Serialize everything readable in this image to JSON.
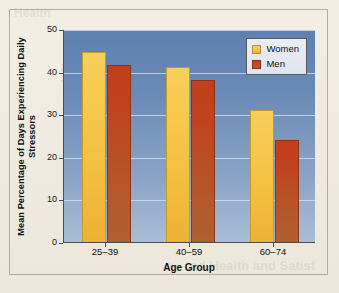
{
  "chart_data": {
    "type": "bar",
    "title": "",
    "xlabel": "Age Group",
    "ylabel": "Mean Percentage of Days Experiencing Daily Stressors",
    "categories": [
      "25–39",
      "40–59",
      "60–74"
    ],
    "series": [
      {
        "name": "Women",
        "values": [
          44.5,
          41.0,
          31.0
        ],
        "color": "#f3bf3f"
      },
      {
        "name": "Men",
        "values": [
          41.5,
          38.0,
          24.0
        ],
        "color": "#bf4a21"
      }
    ],
    "ylim": [
      0,
      50
    ],
    "yticks": [
      0,
      10,
      20,
      30,
      40,
      50
    ],
    "ytick_labels": [
      "0",
      "10",
      "20",
      "30",
      "40",
      "50"
    ],
    "grid": true,
    "legend_position": "top-right"
  },
  "legend": {
    "entries": [
      {
        "label": "Women",
        "swatch": "women-swatch"
      },
      {
        "label": "Men",
        "swatch": "men-swatch"
      }
    ]
  },
  "axis": {
    "y_title": "Mean Percentage of Days Experiencing Daily Stressors",
    "x_title": "Age Group",
    "y_ticks": [
      "50",
      "40",
      "30",
      "20",
      "10",
      "0"
    ],
    "x_ticks": [
      "25–39",
      "40–59",
      "60–74"
    ]
  },
  "background_text": {
    "line1": "aic",
    "line2": "Temp",
    "line3": "od Health and Satisf",
    "line4": "Health"
  },
  "colors": {
    "page": "#efebe0",
    "plot_top": "#5d80b0",
    "plot_bottom": "#a9bdd5",
    "women": "#f3bf3f",
    "men": "#bf4a21",
    "frame": "#b3ada0",
    "axis": "#4c4c4c"
  }
}
